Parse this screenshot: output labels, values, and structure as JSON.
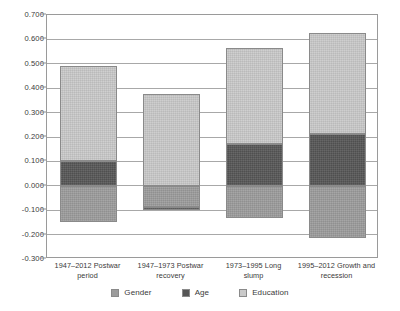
{
  "chart_data": {
    "type": "bar",
    "subtype": "stacked-bar",
    "title": "",
    "xlabel": "",
    "ylabel": "",
    "ylim": [
      -0.3,
      0.7
    ],
    "ytick_step": 0.1,
    "grid": true,
    "legend_position": "bottom",
    "yticks": [
      "0.700",
      "0.600",
      "0.500",
      "0.400",
      "0.300",
      "0.200",
      "0.100",
      "0.000",
      "-0.100",
      "-0.200",
      "-0.300"
    ],
    "ytick_values": [
      0.7,
      0.6,
      0.5,
      0.4,
      0.3,
      0.2,
      0.1,
      0.0,
      -0.1,
      -0.2,
      -0.3
    ],
    "categories": [
      "1947–2012 Postwar period",
      "1947–1973 Postwar recovery",
      "1973–1995 Long slump",
      "1995–2012 Growth and recession"
    ],
    "category_lines": [
      [
        "1947–2012 Postwar",
        "period"
      ],
      [
        "1947–1973 Postwar",
        "recovery"
      ],
      [
        "1973–1995 Long",
        "slump"
      ],
      [
        "1995–2012 Growth and",
        "recession"
      ]
    ],
    "series": [
      {
        "name": "Gender",
        "color": "#9c9c9c",
        "values": [
          -0.15,
          -0.085,
          -0.13,
          -0.215
        ]
      },
      {
        "name": "Age",
        "color": "#565656",
        "values": [
          0.1,
          -0.015,
          0.172,
          0.212
        ]
      },
      {
        "name": "Education",
        "color": "#cacaca",
        "values": [
          0.39,
          0.375,
          0.393,
          0.413
        ]
      }
    ],
    "positive_totals": [
      0.49,
      0.375,
      0.565,
      0.625
    ],
    "negative_totals": [
      -0.15,
      -0.1,
      -0.13,
      -0.215
    ]
  },
  "legend": {
    "items": [
      {
        "label": "Gender"
      },
      {
        "label": "Age"
      },
      {
        "label": "Education"
      }
    ]
  },
  "colors": {
    "gender": "#9c9c9c",
    "age": "#565656",
    "education": "#cacaca",
    "grid": "#a8a8a8",
    "frame": "#9a9a9a",
    "text": "#3a3a3a",
    "background": "#ffffff"
  }
}
